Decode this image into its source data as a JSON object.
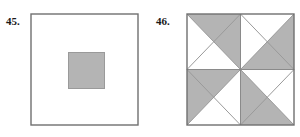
{
  "page": {
    "background_color": "#ffffff",
    "width": 300,
    "height": 137
  },
  "figures": [
    {
      "id": "figure-45",
      "label": "45.",
      "description": "A large white square with a smaller shaded gray square centered inside it.",
      "outline_color": "#707070",
      "fill_color": "#ffffff",
      "shaded_color": "#b4b4b4",
      "shaded_outline_color": "#9a9a9a"
    },
    {
      "id": "figure-46",
      "label": "46.",
      "description": "A large square containing an inscribed diamond whose four triangles are each split into a gray half and a white half, forming a pinwheel.",
      "outline_color": "#707070",
      "fill_color": "#ffffff",
      "shaded_color": "#b4b4b4",
      "diagonal_color": "#9a9a9a"
    }
  ],
  "colors": {
    "ink": "#1a1a1a",
    "outline": "#707070",
    "shade": "#b4b4b4",
    "light_line": "#9a9a9a",
    "paper": "#ffffff"
  }
}
